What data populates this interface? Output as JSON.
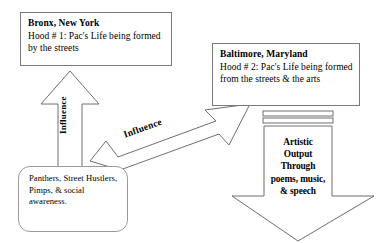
{
  "diagram": {
    "background_color": "#ffffff",
    "stroke_color": "#6e6e6e",
    "text_color": "#000000",
    "nodes": {
      "bronx": {
        "title": "Bronx, New York",
        "body": "Hood # 1: Pac's Life being formed by the streets"
      },
      "baltimore": {
        "title": "Baltimore, Maryland",
        "body": "Hood # 2: Pac's Life being formed from the streets & the arts"
      },
      "origins": {
        "body": "Panthers, Street Hustlers, Pimps, & social awareness."
      },
      "artistic_output": {
        "line1": "Artistic",
        "line2": "Output",
        "line3": "Through",
        "line4": "poems, music,",
        "line5": "& speech"
      }
    },
    "connectors": {
      "influence_up": {
        "label": "Influence",
        "direction": "up",
        "from": "origins",
        "to": "bronx"
      },
      "influence_diagonal": {
        "label": "Influence",
        "direction": "up-right",
        "from": "origins",
        "to": "baltimore"
      },
      "output_down": {
        "label": "",
        "direction": "down",
        "from": "baltimore",
        "to": "artistic_output"
      }
    }
  }
}
